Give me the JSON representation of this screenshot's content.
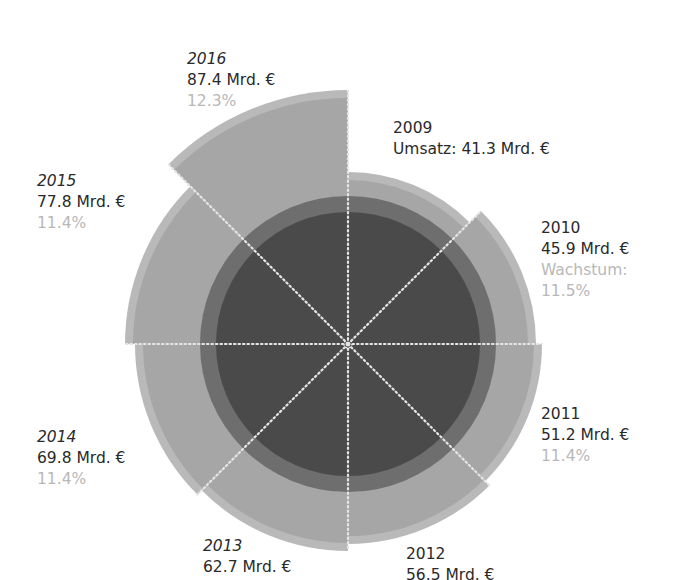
{
  "chart_data": {
    "type": "polar-area",
    "title": "",
    "unit": "Mrd. €",
    "center": [
      348,
      344
    ],
    "base_radius_dark": 132,
    "base_ring_radius": 148,
    "categories": [
      "2009",
      "2010",
      "2011",
      "2012",
      "2013",
      "2014",
      "2015",
      "2016"
    ],
    "series": [
      {
        "name": "Umsatz",
        "values": [
          41.3,
          45.9,
          51.2,
          56.5,
          62.7,
          69.8,
          77.8,
          87.4
        ]
      },
      {
        "name": "Wachstum",
        "values": [
          null,
          11.5,
          11.4,
          null,
          null,
          11.4,
          11.4,
          12.3
        ]
      }
    ],
    "radii_px": [
      172,
      188,
      194,
      200,
      207,
      213,
      223,
      254
    ],
    "colors": {
      "dark": "#4a4a4a",
      "mid": "#6e6e6e",
      "sector": "#a6a6a6",
      "rim": "#b9b9b9",
      "growth_text": "#b8b8b8",
      "text": "#2a2a2a"
    }
  },
  "labels": [
    {
      "year": "2009",
      "value": "Umsatz: 41.3 Mrd. €",
      "growth_label": "",
      "growth": "",
      "italic": false,
      "x": 393,
      "y": 118
    },
    {
      "year": "2010",
      "value": "45.9 Mrd. €",
      "growth_label": "Wachstum:",
      "growth": "11.5%",
      "italic": false,
      "x": 541,
      "y": 218
    },
    {
      "year": "2011",
      "value": "51.2 Mrd. €",
      "growth_label": "",
      "growth": "11.4%",
      "italic": false,
      "x": 541,
      "y": 404
    },
    {
      "year": "2012",
      "value": "56.5 Mrd. €",
      "growth_label": "",
      "growth": "",
      "italic": false,
      "x": 406,
      "y": 544
    },
    {
      "year": "2013",
      "value": "62.7 Mrd. €",
      "growth_label": "",
      "growth": "",
      "italic": true,
      "x": 203,
      "y": 536
    },
    {
      "year": "2014",
      "value": "69.8 Mrd. €",
      "growth_label": "",
      "growth": "11.4%",
      "italic": true,
      "x": 37,
      "y": 427
    },
    {
      "year": "2015",
      "value": "77.8 Mrd. €",
      "growth_label": "",
      "growth": "11.4%",
      "italic": true,
      "x": 37,
      "y": 171
    },
    {
      "year": "2016",
      "value": "87.4 Mrd. €",
      "growth_label": "",
      "growth": "12.3%",
      "italic": true,
      "x": 187,
      "y": 49
    }
  ]
}
